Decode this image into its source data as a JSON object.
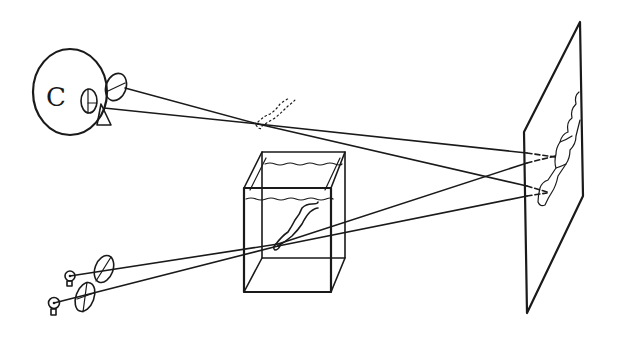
{
  "diagram": {
    "title": "",
    "colors": {
      "ink": "#1a1a1a",
      "background": "#ffffff"
    },
    "components": [
      {
        "id": "eye",
        "label": "Eye (viewer)",
        "icon": "eye-icon"
      },
      {
        "id": "viewing-lens",
        "label": "Viewing lens",
        "icon": "lens-icon"
      },
      {
        "id": "virtual-image",
        "label": "Virtual image of fish (dotted)",
        "icon": "fish-icon"
      },
      {
        "id": "tank",
        "label": "Water tank with fish",
        "icon": "tank-icon"
      },
      {
        "id": "laser-1",
        "label": "Light source 1",
        "icon": "laser-icon"
      },
      {
        "id": "laser-2",
        "label": "Light source 2",
        "icon": "laser-icon"
      },
      {
        "id": "lens-1",
        "label": "Lens 1",
        "icon": "lens-icon"
      },
      {
        "id": "lens-2",
        "label": "Lens 2",
        "icon": "lens-icon"
      },
      {
        "id": "plate",
        "label": "Recording plate / hologram with fish image",
        "icon": "plate-icon"
      }
    ],
    "text_labels": {
      "eye_letter": "C"
    }
  }
}
